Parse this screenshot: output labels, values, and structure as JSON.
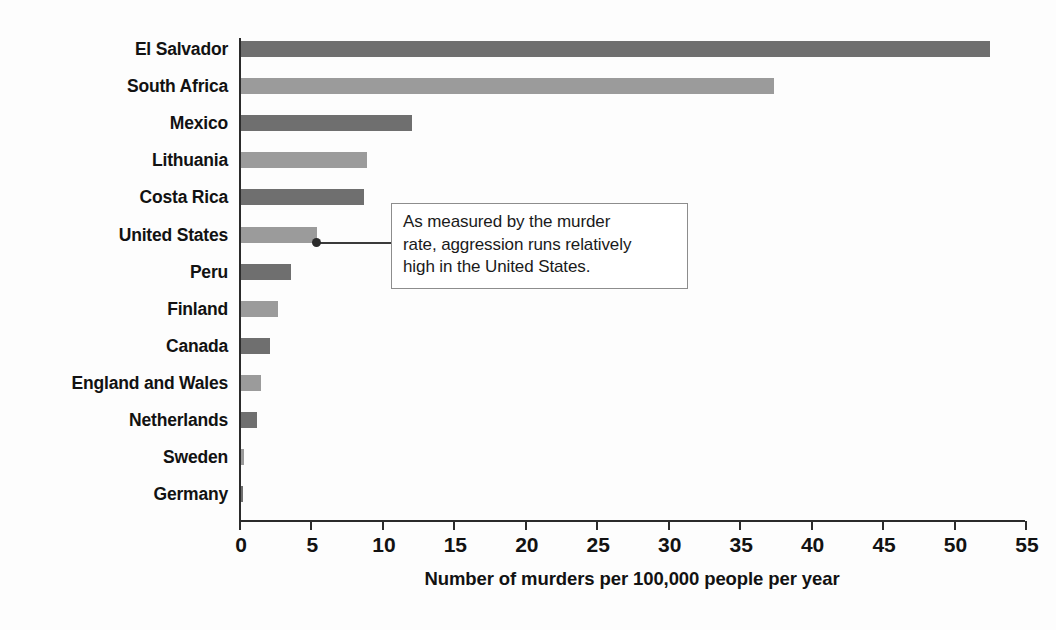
{
  "chart_data": {
    "type": "bar",
    "orientation": "horizontal",
    "title": "",
    "xlabel": "Number of murders per 100,000 people per year",
    "ylabel": "",
    "xlim": [
      0,
      55
    ],
    "xticks": [
      0,
      5,
      10,
      15,
      20,
      25,
      30,
      35,
      40,
      45,
      50,
      55
    ],
    "grid": false,
    "legend": null,
    "categories": [
      "El Salvador",
      "South Africa",
      "Mexico",
      "Lithuania",
      "Costa Rica",
      "United States",
      "Peru",
      "Finland",
      "Canada",
      "England and Wales",
      "Netherlands",
      "Sweden",
      "Germany"
    ],
    "values": [
      52.4,
      37.3,
      12.0,
      8.8,
      8.6,
      5.3,
      3.5,
      2.6,
      2.0,
      1.4,
      1.1,
      0.2,
      0.1
    ],
    "bar_colors": [
      "#6f6f6f",
      "#9b9b9b",
      "#6f6f6f",
      "#9b9b9b",
      "#6f6f6f",
      "#9b9b9b",
      "#6f6f6f",
      "#9b9b9b",
      "#6f6f6f",
      "#9b9b9b",
      "#6f6f6f",
      "#9b9b9b",
      "#6f6f6f"
    ],
    "annotations": [
      {
        "text": "As measured by the murder rate, aggression runs relatively high in the United States.",
        "target_category": "United States"
      }
    ]
  },
  "annotation": {
    "line1": "As measured by the murder",
    "line2": "rate, aggression runs relatively",
    "line3": "high in the United States."
  },
  "axis": {
    "x_title": "Number of murders per 100,000 people per year"
  },
  "colors": {
    "background": "#fdfdfd",
    "axis": "#2b2b2b",
    "bar_dark": "#6f6f6f",
    "bar_light": "#9b9b9b",
    "text": "#121212",
    "callout_border": "#8d8d8d"
  }
}
